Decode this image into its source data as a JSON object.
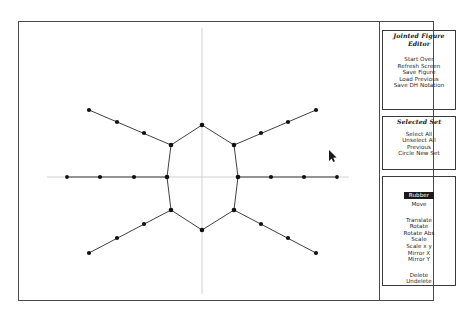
{
  "window": {
    "title": "Jointed Figure Editor"
  },
  "panel": {
    "sections": [
      {
        "title_line1": "Jointed Figure",
        "title_line2": "Editor",
        "items": [
          "Start Over",
          "Refresh Screen",
          "Save Figure",
          "Load Previous",
          "Save DH Notation"
        ]
      },
      {
        "title_line1": "Selected Set",
        "title_line2": "",
        "items": [
          "Select All",
          "Unselect All",
          "Previous",
          "Circle New Set"
        ]
      },
      {
        "title_line1": "",
        "title_line2": "",
        "selected_item": "Rubber",
        "items_group_a": [
          "Move"
        ],
        "items_group_b": [
          "Translate",
          "Rotate",
          "Rotate Abs",
          "Scale",
          "Scale x y",
          "Mirror X",
          "Mirror Y"
        ],
        "items_group_c": [
          "Delete",
          "Undelete"
        ]
      }
    ]
  },
  "canvas": {
    "description": "Jointed stick figure with lens-shaped body and four limbs",
    "line_color": "#2b2b2b",
    "joint_color": "#111111",
    "axis_color": "#c8c8c8",
    "vertical_axis_x": 201,
    "horizontal_axis_y": 152,
    "body": {
      "top_vertex": [
        201,
        100
      ],
      "bottom_vertex": [
        201,
        205
      ],
      "left_upper": [
        170,
        120
      ],
      "right_upper": [
        233,
        120
      ],
      "left_mid": [
        166,
        152
      ],
      "right_mid": [
        236,
        152
      ],
      "left_lower": [
        170,
        185
      ],
      "right_lower": [
        233,
        185
      ]
    },
    "limbs": [
      {
        "name": "upper-left-arm",
        "points": [
          [
            170,
            120
          ],
          [
            144,
            110
          ],
          [
            116,
            98
          ],
          [
            88,
            86
          ]
        ]
      },
      {
        "name": "upper-right-arm",
        "points": [
          [
            233,
            120
          ],
          [
            260,
            110
          ],
          [
            288,
            98
          ],
          [
            315,
            86
          ]
        ]
      },
      {
        "name": "lower-left-arm",
        "points": [
          [
            170,
            185
          ],
          [
            144,
            198
          ],
          [
            116,
            212
          ],
          [
            88,
            226
          ]
        ]
      },
      {
        "name": "lower-right-arm",
        "points": [
          [
            233,
            185
          ],
          [
            260,
            198
          ],
          [
            288,
            212
          ],
          [
            315,
            226
          ]
        ]
      },
      {
        "name": "left-horizontal-arm",
        "points": [
          [
            166,
            152
          ],
          [
            130,
            152
          ],
          [
            96,
            152
          ],
          [
            62,
            152
          ]
        ]
      },
      {
        "name": "right-horizontal-arm",
        "points": [
          [
            236,
            152
          ],
          [
            272,
            152
          ],
          [
            306,
            152
          ],
          [
            340,
            152
          ]
        ]
      }
    ],
    "cursor": {
      "x": 330,
      "y": 145
    }
  }
}
